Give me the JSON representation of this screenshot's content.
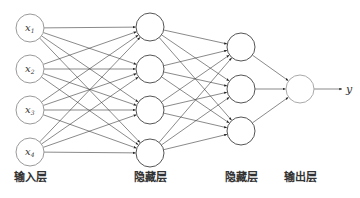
{
  "diagram": {
    "layers": [
      {
        "id": "input",
        "label": "输入层",
        "nodes": [
          {
            "symbol": "x",
            "subscript": "1"
          },
          {
            "symbol": "x",
            "subscript": "2"
          },
          {
            "symbol": "x",
            "subscript": "3"
          },
          {
            "symbol": "x",
            "subscript": "4"
          }
        ]
      },
      {
        "id": "hidden1",
        "label": "隐藏层",
        "nodes": [
          {},
          {},
          {},
          {}
        ]
      },
      {
        "id": "hidden2",
        "label": "隐藏层",
        "nodes": [
          {},
          {},
          {}
        ]
      },
      {
        "id": "output",
        "label": "输出层",
        "nodes": [
          {}
        ]
      }
    ],
    "connections": "fully-connected",
    "output_label": "y"
  }
}
